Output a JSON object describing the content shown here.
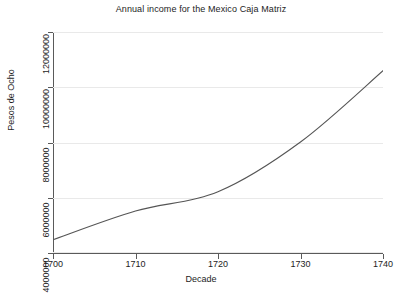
{
  "chart_data": {
    "type": "line",
    "title": "Annual income for the Mexico Caja Matriz",
    "xlabel": "Decade",
    "ylabel": "Pesos de Ocho",
    "x": [
      1700,
      1710,
      1720,
      1730,
      1740
    ],
    "xtick_labels": [
      "1700",
      "1710",
      "1720",
      "1730",
      "1740"
    ],
    "ytick_labels": [
      "4000000",
      "6000000",
      "8000000",
      "10000000",
      "12000000"
    ],
    "ytick_values": [
      4000000,
      6000000,
      8000000,
      10000000,
      12000000
    ],
    "xlim": [
      1700,
      1740
    ],
    "ylim": [
      4000000,
      12000000
    ],
    "grid": "horizontal",
    "legend": "none",
    "series": [
      {
        "name": "Annual income",
        "values": [
          4480000,
          5520000,
          6220000,
          8020000,
          10600000
        ]
      }
    ],
    "line_color": "#555555",
    "grid_color": "#e9e9e9",
    "axis_color": "#5a5a5a",
    "background_color": "#ffffff"
  }
}
